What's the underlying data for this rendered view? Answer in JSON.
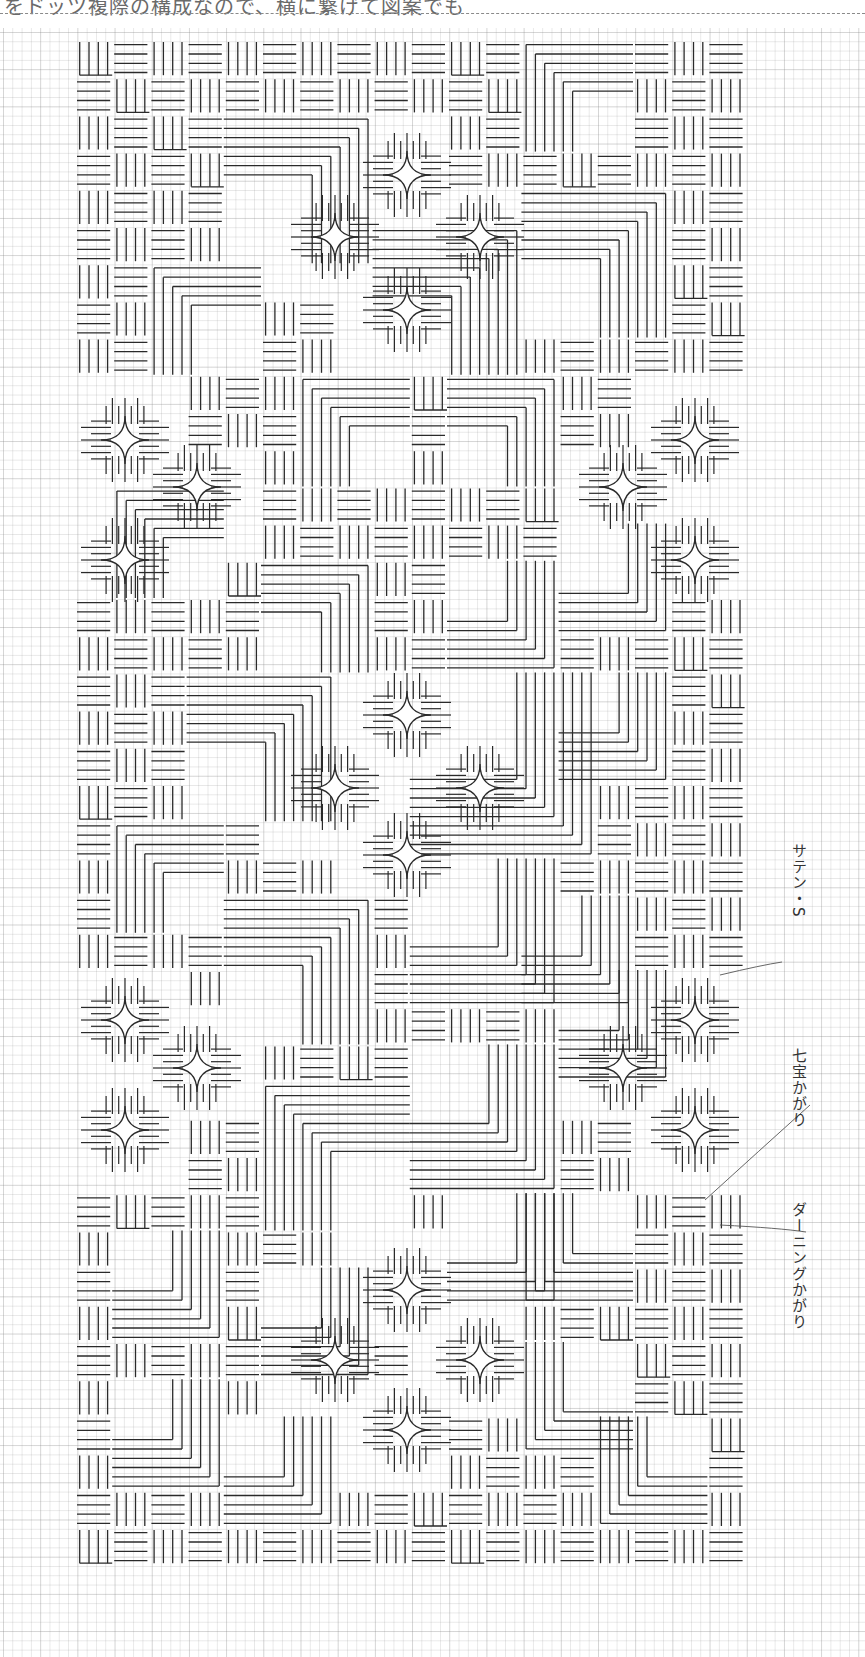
{
  "header": {
    "text": "をドッツ複際の構成なので、横に繋げて図案でも"
  },
  "pattern": {
    "origin_x": 75,
    "origin_y": 40,
    "block": 37.2,
    "cols": 18,
    "rows": 41,
    "stitch_color": "#2a2a2a",
    "grid_color": "#bdbdbd",
    "corner_groups": [
      {
        "x": 4,
        "y": 2,
        "size": 7,
        "dir": "tr"
      },
      {
        "x": 2,
        "y": 6,
        "size": 5,
        "dir": "tl"
      },
      {
        "x": 8,
        "y": 5,
        "size": 8,
        "dir": "tr"
      },
      {
        "x": 6,
        "y": 9,
        "size": 6,
        "dir": "tl"
      },
      {
        "x": 12,
        "y": 0,
        "size": 6,
        "dir": "tl"
      },
      {
        "x": 12,
        "y": 4,
        "size": 8,
        "dir": "tr"
      },
      {
        "x": 10,
        "y": 9,
        "size": 6,
        "dir": "tr"
      },
      {
        "x": 1,
        "y": 12,
        "size": 6,
        "dir": "tl"
      },
      {
        "x": 5,
        "y": 14,
        "size": 6,
        "dir": "tr"
      },
      {
        "x": 10,
        "y": 14,
        "size": 6,
        "dir": "br"
      },
      {
        "x": 13,
        "y": 13,
        "size": 5,
        "dir": "br"
      },
      {
        "x": 3,
        "y": 17,
        "size": 8,
        "dir": "tr"
      },
      {
        "x": 9,
        "y": 17,
        "size": 9,
        "dir": "br"
      },
      {
        "x": 13,
        "y": 17,
        "size": 6,
        "dir": "br"
      },
      {
        "x": 1,
        "y": 21,
        "size": 6,
        "dir": "tl"
      },
      {
        "x": 4,
        "y": 23,
        "size": 8,
        "dir": "tr"
      },
      {
        "x": 9,
        "y": 22,
        "size": 7,
        "dir": "br"
      },
      {
        "x": 12,
        "y": 23,
        "size": 6,
        "dir": "br"
      },
      {
        "x": 5,
        "y": 28,
        "size": 8,
        "dir": "tl"
      },
      {
        "x": 9,
        "y": 27,
        "size": 8,
        "dir": "br"
      },
      {
        "x": 13,
        "y": 25,
        "size": 6,
        "dir": "br"
      },
      {
        "x": 1,
        "y": 32,
        "size": 6,
        "dir": "br"
      },
      {
        "x": 5,
        "y": 33,
        "size": 6,
        "dir": "br"
      },
      {
        "x": 10,
        "y": 31,
        "size": 5,
        "dir": "br"
      },
      {
        "x": 12,
        "y": 31,
        "size": 6,
        "dir": "bl"
      },
      {
        "x": 1,
        "y": 36,
        "size": 6,
        "dir": "br"
      },
      {
        "x": 4,
        "y": 37,
        "size": 6,
        "dir": "br"
      },
      {
        "x": 12,
        "y": 35,
        "size": 5,
        "dir": "bl"
      },
      {
        "x": 14,
        "y": 37,
        "size": 6,
        "dir": "bl"
      }
    ],
    "stars": [
      [
        407,
        175
      ],
      [
        335,
        237
      ],
      [
        480,
        237
      ],
      [
        407,
        310
      ],
      [
        125,
        440
      ],
      [
        695,
        440
      ],
      [
        197,
        487
      ],
      [
        623,
        487
      ],
      [
        125,
        560
      ],
      [
        695,
        560
      ],
      [
        407,
        715
      ],
      [
        335,
        788
      ],
      [
        480,
        788
      ],
      [
        407,
        855
      ],
      [
        125,
        1020
      ],
      [
        695,
        1020
      ],
      [
        197,
        1068
      ],
      [
        623,
        1068
      ],
      [
        125,
        1130
      ],
      [
        695,
        1130
      ],
      [
        407,
        1290
      ],
      [
        335,
        1360
      ],
      [
        480,
        1360
      ],
      [
        407,
        1430
      ]
    ]
  },
  "labels": [
    {
      "id": "satin-s",
      "text": "サテン・S",
      "x": 788,
      "y": 843,
      "leader": [
        [
          782,
          962
        ],
        [
          762,
          965
        ],
        [
          720,
          975
        ]
      ]
    },
    {
      "id": "shippo",
      "text": "七宝かがり",
      "x": 788,
      "y": 1048,
      "leader": [
        [
          810,
          1105
        ],
        [
          760,
          1150
        ],
        [
          705,
          1200
        ]
      ]
    },
    {
      "id": "darning",
      "text": "ダーニングかがり",
      "x": 788,
      "y": 1202,
      "leader": [
        [
          806,
          1232
        ],
        [
          780,
          1228
        ],
        [
          720,
          1225
        ]
      ]
    }
  ]
}
